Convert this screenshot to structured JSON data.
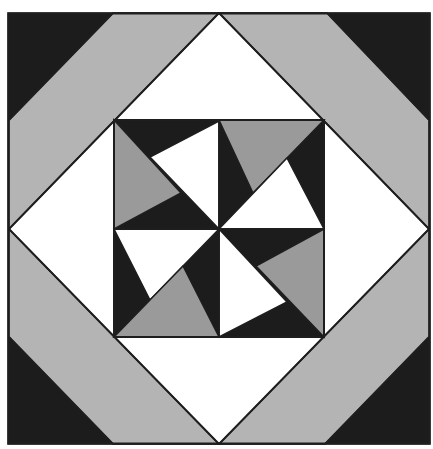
{
  "figure": {
    "type": "quilt-block",
    "width": 433,
    "height": 449
  },
  "colors": {
    "black": "#1c1c1c",
    "light_gray": "#b4b4b4",
    "mid_gray": "#9a9a9a",
    "white": "#ffffff",
    "line": "#1e1e1e"
  },
  "shapes": [
    {
      "name": "outer-frame-background",
      "fill": "black",
      "points": [
        [
          8,
          13
        ],
        [
          430,
          13
        ],
        [
          430,
          444
        ],
        [
          8,
          444
        ]
      ]
    },
    {
      "name": "band-top-left",
      "fill": "light_gray",
      "points": [
        [
          113,
          13
        ],
        [
          219,
          13
        ],
        [
          9,
          229
        ],
        [
          9,
          120
        ]
      ]
    },
    {
      "name": "band-top-right",
      "fill": "light_gray",
      "points": [
        [
          219,
          13
        ],
        [
          327,
          13
        ],
        [
          429,
          120
        ],
        [
          429,
          229
        ]
      ]
    },
    {
      "name": "band-bottom-right",
      "fill": "light_gray",
      "points": [
        [
          429,
          229
        ],
        [
          429,
          337
        ],
        [
          325,
          444
        ],
        [
          219,
          444
        ]
      ]
    },
    {
      "name": "band-bottom-left",
      "fill": "light_gray",
      "points": [
        [
          219,
          444
        ],
        [
          113,
          444
        ],
        [
          9,
          337
        ],
        [
          9,
          229
        ]
      ]
    },
    {
      "name": "white-diamond",
      "fill": "white",
      "points": [
        [
          219,
          13
        ],
        [
          429,
          229
        ],
        [
          219,
          444
        ],
        [
          9,
          229
        ]
      ]
    },
    {
      "name": "inner-square",
      "fill": "black",
      "points": [
        [
          114,
          120
        ],
        [
          324,
          120
        ],
        [
          324,
          337
        ],
        [
          114,
          337
        ]
      ]
    },
    {
      "name": "pinwheel-tl-gray",
      "fill": "mid_gray",
      "points": [
        [
          114,
          120
        ],
        [
          114,
          229
        ],
        [
          181,
          193
        ]
      ]
    },
    {
      "name": "pinwheel-tl-white",
      "fill": "white",
      "points": [
        [
          219,
          121
        ],
        [
          219,
          229
        ],
        [
          150,
          157
        ]
      ]
    },
    {
      "name": "pinwheel-tr-gray",
      "fill": "mid_gray",
      "points": [
        [
          219,
          120
        ],
        [
          324,
          120
        ],
        [
          253,
          193
        ]
      ]
    },
    {
      "name": "pinwheel-tr-white",
      "fill": "white",
      "points": [
        [
          219,
          229
        ],
        [
          324,
          229
        ],
        [
          287,
          158
        ]
      ]
    },
    {
      "name": "pinwheel-bl-white",
      "fill": "white",
      "points": [
        [
          114,
          229
        ],
        [
          219,
          229
        ],
        [
          150,
          300
        ]
      ]
    },
    {
      "name": "pinwheel-bl-gray",
      "fill": "mid_gray",
      "points": [
        [
          114,
          337
        ],
        [
          219,
          337
        ],
        [
          183,
          266
        ]
      ]
    },
    {
      "name": "pinwheel-br-white",
      "fill": "white",
      "points": [
        [
          219,
          229
        ],
        [
          219,
          337
        ],
        [
          287,
          302
        ]
      ]
    },
    {
      "name": "pinwheel-br-gray",
      "fill": "mid_gray",
      "points": [
        [
          324,
          229
        ],
        [
          324,
          337
        ],
        [
          256,
          266
        ]
      ]
    }
  ],
  "lines": [
    {
      "name": "diamond-edge-tl",
      "from": [
        219,
        13
      ],
      "to": [
        9,
        229
      ]
    },
    {
      "name": "diamond-edge-tr",
      "from": [
        219,
        13
      ],
      "to": [
        429,
        229
      ]
    },
    {
      "name": "diamond-edge-br",
      "from": [
        429,
        229
      ],
      "to": [
        219,
        444
      ]
    },
    {
      "name": "diamond-edge-bl",
      "from": [
        9,
        229
      ],
      "to": [
        219,
        444
      ]
    },
    {
      "name": "band-edge-tl",
      "from": [
        113,
        13
      ],
      "to": [
        9,
        120
      ]
    },
    {
      "name": "band-edge-tr",
      "from": [
        327,
        13
      ],
      "to": [
        429,
        120
      ]
    },
    {
      "name": "band-edge-br",
      "from": [
        429,
        337
      ],
      "to": [
        325,
        444
      ]
    },
    {
      "name": "band-edge-bl",
      "from": [
        9,
        337
      ],
      "to": [
        113,
        444
      ]
    },
    {
      "name": "inner-square-mid-vertical",
      "from": [
        219,
        120
      ],
      "to": [
        219,
        337
      ]
    },
    {
      "name": "inner-square-mid-horizontal",
      "from": [
        114,
        229
      ],
      "to": [
        324,
        229
      ]
    }
  ]
}
